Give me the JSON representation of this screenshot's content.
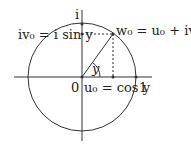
{
  "diagram": {
    "type": "unit-circle",
    "labels": {
      "imag_axis": "i",
      "imag_point": "iv₀ = i sin y",
      "point": "w₀ = u₀ + iv₀",
      "origin": "0",
      "real_point": "u₀ = cos y",
      "one": "1",
      "angle": "y"
    },
    "geometry": {
      "center": [
        82,
        77
      ],
      "radius": 54,
      "point": [
        113,
        34
      ]
    },
    "colors": {
      "stroke": "#333333",
      "text": "#222222"
    }
  }
}
